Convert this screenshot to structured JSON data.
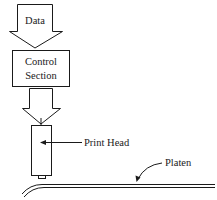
{
  "diagram": {
    "type": "block-flow",
    "data_arrow": {
      "label": "Data"
    },
    "control_box": {
      "line1": "Control",
      "line2": "Section"
    },
    "print_head": {
      "label": "Print Head"
    },
    "platen": {
      "label": "Platen"
    }
  },
  "colors": {
    "stroke": "#1a1a1a",
    "background": "#ffffff"
  }
}
